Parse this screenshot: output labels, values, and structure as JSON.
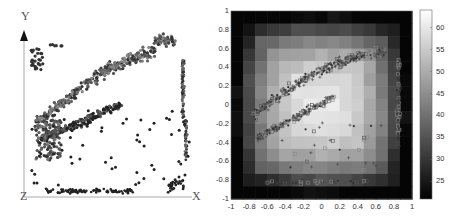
{
  "figure": {
    "left_panel": {
      "axis_labels": {
        "y": "Y",
        "z": "Z",
        "x": "X"
      }
    },
    "right_panel": {
      "x_ticks": [
        "-1",
        "-0.8",
        "-0.6",
        "-0.4",
        "-0.2",
        "0",
        "0.2",
        "0.4",
        "0.6",
        "0.8",
        "1"
      ],
      "y_ticks": [
        "1",
        "0.8",
        "0.6",
        "0.4",
        "0.2",
        "0",
        "-0.2",
        "-0.4",
        "-0.6",
        "-0.8",
        "-1"
      ],
      "colorbar_ticks": [
        "60",
        "55",
        "50",
        "45",
        "40",
        "35",
        "30",
        "25"
      ]
    }
  },
  "chart_data": [
    {
      "type": "scatter",
      "title": "",
      "description": "3D point cloud projected onto X-Y plane with Z axis at origin",
      "axis_labels": [
        "X",
        "Y",
        "Z"
      ],
      "grid": false,
      "series": [
        {
          "name": "upper arc cluster",
          "approx_region": "rising arc from lower-left (~0.15,0.45) to upper-right (~0.9,0.9)"
        },
        {
          "name": "inner diagonal band",
          "approx_region": "diagonal band from (~0.2,0.35) to (~0.65,0.65)"
        },
        {
          "name": "right vertical strip",
          "approx_region": "x≈0.95, y from 0.3 to 0.85"
        },
        {
          "name": "bottom row",
          "approx_region": "y≈0.05, x from 0.2 to 0.9"
        }
      ]
    },
    {
      "type": "heatmap",
      "title": "",
      "xlabel": "",
      "ylabel": "",
      "xlim": [
        -1,
        1
      ],
      "ylim": [
        -1,
        1
      ],
      "x_ticks": [
        -1,
        -0.8,
        -0.6,
        -0.4,
        -0.2,
        0,
        0.2,
        0.4,
        0.6,
        0.8,
        1
      ],
      "y_ticks": [
        -1,
        -0.8,
        -0.6,
        -0.4,
        -0.2,
        0,
        0.2,
        0.4,
        0.6,
        0.8,
        1
      ],
      "colorbar": {
        "range": [
          21,
          64
        ],
        "ticks": [
          25,
          30,
          35,
          40,
          45,
          50,
          55,
          60
        ],
        "colormap": "gray"
      },
      "grid_size": [
        15,
        15
      ],
      "pattern": "radial: values ~22-28 at corners, ~35-45 at edges, ~55-63 in center",
      "overlay": "scatter points (squares, crosses, dots) forming same arc/band structure as left panel"
    }
  ]
}
